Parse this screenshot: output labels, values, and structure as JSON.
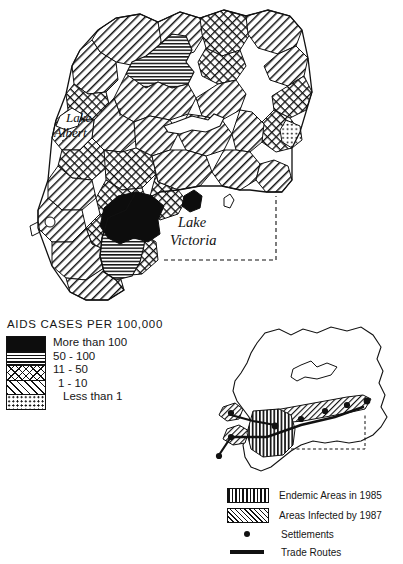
{
  "figure": {
    "kind": "choropleth-map-with-inset",
    "region": "Uganda"
  },
  "main_map": {
    "water_labels": [
      {
        "id": "lake-albert",
        "line1": "Lake",
        "line2": "Albert"
      },
      {
        "id": "lake-victoria",
        "line1": "Lake",
        "line2": "Victoria"
      }
    ]
  },
  "legend_choropleth": {
    "title": "AIDS CASES PER 100,000",
    "items": [
      {
        "pattern": "solid-black",
        "label": "More than 100",
        "indent": 0
      },
      {
        "pattern": "horizontal-lines",
        "label": "50 - 100",
        "indent": 0
      },
      {
        "pattern": "cross-hatch",
        "label": "11 - 50",
        "indent": 0
      },
      {
        "pattern": "diagonal-lines",
        "label": "1 - 10",
        "indent": 1
      },
      {
        "pattern": "dots",
        "label": "Less than 1",
        "indent": 2
      }
    ]
  },
  "legend_inset": {
    "items": [
      {
        "symbol": "vertical-lines-swatch",
        "label": "Endemic Areas in 1985"
      },
      {
        "symbol": "diagonal-hatch-swatch",
        "label": "Areas Infected by 1987"
      },
      {
        "symbol": "dot-marker",
        "label": "Settlements"
      },
      {
        "symbol": "thick-line",
        "label": "Trade Routes"
      }
    ]
  },
  "colors": {
    "ink": "#111111",
    "paper": "#ffffff",
    "fill_highest": "#0d0d0d"
  }
}
